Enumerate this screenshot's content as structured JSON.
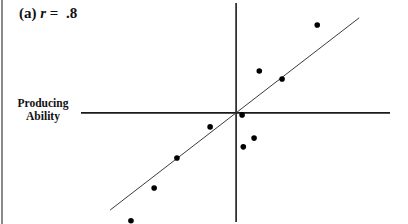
{
  "chart_data": {
    "type": "scatter",
    "title": {
      "prefix": "(a) ",
      "variable": "r",
      "suffix": " =  .8"
    },
    "correlation": 0.8,
    "xlabel": "",
    "ylabel_lines": [
      "Producing",
      "Ability"
    ],
    "axes_style": "cross-at-origin",
    "xlim": [
      -3.88,
      3.85
    ],
    "ylim": [
      -2.73,
      2.75
    ],
    "grid": false,
    "legend": "none",
    "points": [
      {
        "x": 2.03,
        "y": 2.2
      },
      {
        "x": 0.58,
        "y": 1.05
      },
      {
        "x": 1.15,
        "y": 0.85
      },
      {
        "x": 0.15,
        "y": -0.05
      },
      {
        "x": -0.65,
        "y": -0.35
      },
      {
        "x": 0.45,
        "y": -0.63
      },
      {
        "x": 0.18,
        "y": -0.85
      },
      {
        "x": -1.48,
        "y": -1.13
      },
      {
        "x": -2.05,
        "y": -1.88
      },
      {
        "x": -2.63,
        "y": -2.7
      }
    ],
    "regression_line": {
      "x": [
        -3.15,
        3.08
      ],
      "y": [
        -2.43,
        2.38
      ]
    },
    "colors": {
      "points": "#000000",
      "axes": "#1a1a1a",
      "regression_line": "#3a3a3a",
      "frame": "#8a8a8a"
    }
  }
}
